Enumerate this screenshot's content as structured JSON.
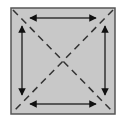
{
  "diagram": {
    "type": "square-with-diagonals-and-side-arrows",
    "colors": {
      "background": "#ffffff",
      "fill": "#c8c8c8",
      "border": "#555555",
      "diagonal": "#333333",
      "arrow": "#111111"
    },
    "square": {
      "x": 11,
      "y": 8,
      "width": 104,
      "height": 106
    },
    "diagonals": [
      {
        "name": "main-diagonal",
        "from": "top-left",
        "to": "bottom-right",
        "style": "dashed"
      },
      {
        "name": "anti-diagonal",
        "from": "top-right",
        "to": "bottom-left",
        "style": "dashed"
      }
    ],
    "arrows": [
      {
        "name": "top-arrow",
        "side": "top",
        "direction": "double-headed-horizontal"
      },
      {
        "name": "bottom-arrow",
        "side": "bottom",
        "direction": "double-headed-horizontal"
      },
      {
        "name": "left-arrow",
        "side": "left",
        "direction": "double-headed-vertical"
      },
      {
        "name": "right-arrow",
        "side": "right",
        "direction": "double-headed-vertical"
      }
    ]
  }
}
